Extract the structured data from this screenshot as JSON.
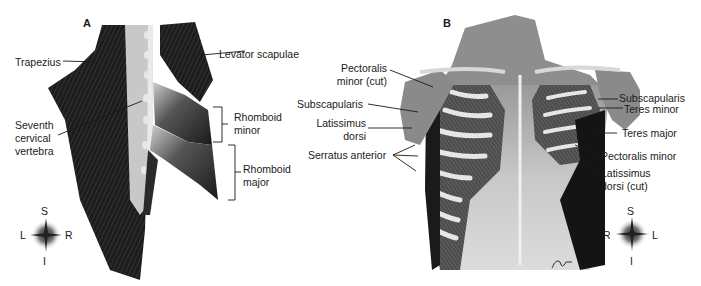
{
  "figure": {
    "panels": [
      {
        "id": "A",
        "letter": "A",
        "view": "posterior",
        "labels": {
          "trapezius": "Trapezius",
          "levator_scapulae": "Levator scapulae",
          "seventh_cervical_1": "Seventh",
          "seventh_cervical_2": "cervical",
          "seventh_cervical_3": "vertebra",
          "rhomboid_minor_1": "Rhomboid",
          "rhomboid_minor_2": "minor",
          "rhomboid_major_1": "Rhomboid",
          "rhomboid_major_2": "major"
        },
        "compass": {
          "top": "S",
          "left": "L",
          "right": "R",
          "bottom": "I"
        }
      },
      {
        "id": "B",
        "letter": "B",
        "view": "anterior",
        "labels": {
          "pectoralis_minor_cut_1": "Pectoralis",
          "pectoralis_minor_cut_2": "minor (cut)",
          "subscapularis_left": "Subscapularis",
          "latissimus_dorsi_1": "Latissimus",
          "latissimus_dorsi_2": "dorsi",
          "serratus_anterior": "Serratus anterior",
          "subscapularis_right": "Subscapularis",
          "teres_minor": "Teres minor",
          "teres_major": "Teres major",
          "pectoralis_minor": "Pectoralis minor",
          "latissimus_dorsi_cut_1": "Latissimus",
          "latissimus_dorsi_cut_2": "dorsi (cut)"
        },
        "compass": {
          "top": "S",
          "left": "R",
          "right": "L",
          "bottom": "I"
        }
      }
    ]
  }
}
